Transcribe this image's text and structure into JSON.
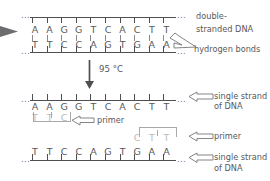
{
  "diagram": {
    "colors": {
      "ink": "#58585a",
      "backbone": "#4f4f51",
      "hbond": "#8a8a8c",
      "faint": "#b9b9bb",
      "arrow_dark": "#6d6d70"
    }
  },
  "panels": {
    "duplex": {
      "top_strand_bases": [
        "A",
        "A",
        "G",
        "G",
        "T",
        "C",
        "A",
        "C",
        "T",
        "T"
      ],
      "bottom_strand_bases": [
        "T",
        "T",
        "C",
        "C",
        "A",
        "G",
        "T",
        "G",
        "A",
        "A"
      ],
      "hydrogen_bond_count": 10,
      "continuation_mark": "...",
      "labels": {
        "double_stranded": "double-\nstranded DNA",
        "double_stranded_line1": "double-",
        "double_stranded_line2": "stranded DNA",
        "hydrogen_bonds": "hydrogen bonds"
      }
    },
    "denature": {
      "temperature": "95 °C",
      "arrow": "down-arrow-icon"
    },
    "single_top": {
      "bases": [
        "A",
        "A",
        "G",
        "G",
        "T",
        "C",
        "A",
        "C",
        "T",
        "T"
      ],
      "continuation_mark": "...",
      "label_line1": "single strand",
      "label_line2": "of DNA",
      "primer": {
        "bases": [
          "T",
          "T",
          "C"
        ],
        "label": "primer"
      }
    },
    "single_bottom": {
      "bases": [
        "T",
        "T",
        "C",
        "C",
        "A",
        "G",
        "T",
        "G",
        "A",
        "A"
      ],
      "continuation_mark": "...",
      "label_line1": "single strand",
      "label_line2": "of DNA",
      "primer": {
        "bases": [
          "C",
          "T",
          "T"
        ],
        "label": "primer"
      }
    }
  }
}
